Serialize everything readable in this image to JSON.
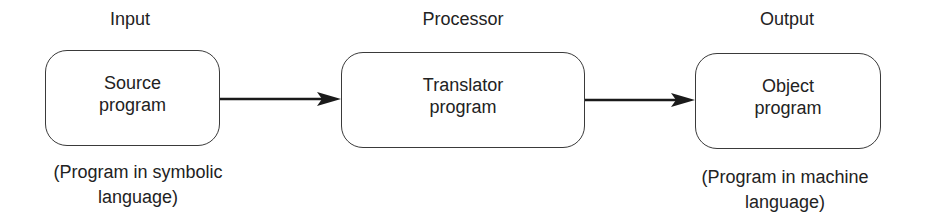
{
  "diagram": {
    "stages": [
      {
        "title": "Input",
        "box_lines": [
          "Source",
          "program"
        ],
        "caption_lines": [
          "(Program in symbolic",
          "language)"
        ]
      },
      {
        "title": "Processor",
        "box_lines": [
          "Translator",
          "program"
        ],
        "caption_lines": []
      },
      {
        "title": "Output",
        "box_lines": [
          "Object",
          "program"
        ],
        "caption_lines": [
          "(Program in machine",
          "language)"
        ]
      }
    ],
    "edges": [
      {
        "from": "Source program",
        "to": "Translator program"
      },
      {
        "from": "Translator program",
        "to": "Object program"
      }
    ],
    "colors": {
      "line": "#1a1a1a",
      "border": "#3a3a3a",
      "text": "#222222",
      "background": "#ffffff"
    }
  }
}
